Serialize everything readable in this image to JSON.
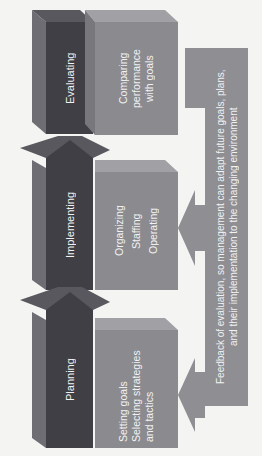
{
  "colors": {
    "background": "#f4f4f2",
    "stage_dark": "#3f3f45",
    "stage_side": "#6d6d73",
    "stage_top": "#58585e",
    "box_face": "#8a8a8f",
    "box_top": "#a0a0a5",
    "box_side": "#77777c",
    "feedback": "#8e8e93",
    "text": "#f2f2f2"
  },
  "stages": [
    {
      "id": "planning",
      "label": "Planning",
      "activities": [
        "Setting goals",
        "Selecting strategies",
        "and tactics"
      ]
    },
    {
      "id": "implementing",
      "label": "Implementing",
      "activities": [
        "Organizing",
        "Staffing",
        "Operating"
      ]
    },
    {
      "id": "evaluating",
      "label": "Evaluating",
      "activities": [
        "Comparing",
        "performance",
        "with goals"
      ]
    }
  ],
  "feedback": {
    "line1": "Feedback of evaluation, so management can adapt future goals, plans,",
    "line2": "and their implementation to the changing environment"
  }
}
